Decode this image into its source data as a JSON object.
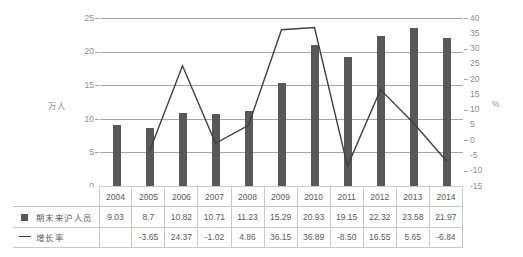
{
  "chart_data": {
    "type": "bar",
    "title": "",
    "xlabel": "",
    "ylabel": "万人",
    "ylabel_right": "%",
    "ylim": [
      0,
      25
    ],
    "ylim_right": [
      -15,
      40
    ],
    "grid": true,
    "legend_position": "table-below",
    "categories": [
      "2004",
      "2005",
      "2006",
      "2007",
      "2008",
      "2009",
      "2010",
      "2011",
      "2012",
      "2013",
      "2014"
    ],
    "series": [
      {
        "name": "期末来沪人员",
        "type": "bar",
        "axis": "left",
        "unit": "万人",
        "color": "#585858",
        "marker": "square",
        "values": [
          9.03,
          8.7,
          10.82,
          10.71,
          11.23,
          15.29,
          20.93,
          19.15,
          22.32,
          23.58,
          21.97
        ],
        "labels": [
          "9.03",
          "8.7",
          "10.82",
          "10.71",
          "11.23",
          "15.29",
          "20.93",
          "19.15",
          "22.32",
          "23.58",
          "21.97"
        ]
      },
      {
        "name": "增长率",
        "type": "line",
        "axis": "right",
        "unit": "%",
        "color": "#3f3f3f",
        "marker": "line",
        "values": [
          null,
          -3.65,
          24.37,
          -1.02,
          4.86,
          36.15,
          36.89,
          -8.5,
          16.55,
          5.65,
          -6.84
        ],
        "labels": [
          "",
          "-3.65",
          "24.37",
          "-1.02",
          "4.86",
          "36.15",
          "36.89",
          "-8.50",
          "16.55",
          "5.65",
          "-6.84"
        ]
      }
    ],
    "yticks_left": [
      "0",
      "5",
      "10",
      "15",
      "20",
      "25"
    ],
    "yticks_right": [
      "-15",
      "-10",
      "-5",
      "0",
      "5",
      "10",
      "15",
      "20",
      "25",
      "30",
      "35",
      "40"
    ]
  },
  "axes": {
    "left_label": "万人",
    "right_label": "%",
    "left_ticks": [
      "25",
      "20",
      "15",
      "10",
      "5",
      "0"
    ],
    "right_ticks": [
      "40",
      "35",
      "30",
      "25",
      "20",
      "15",
      "10",
      "5",
      "0",
      "-5",
      "-10",
      "-15"
    ]
  },
  "table": {
    "year_header": [
      "2004",
      "2005",
      "2006",
      "2007",
      "2008",
      "2009",
      "2010",
      "2011",
      "2012",
      "2013",
      "2014"
    ],
    "rows": [
      {
        "legend": "期末来沪人员",
        "marker": "square-marker-icon",
        "values": [
          "9.03",
          "8.7",
          "10.82",
          "10.71",
          "11.23",
          "15.29",
          "20.93",
          "19.15",
          "22.32",
          "23.58",
          "21.97"
        ]
      },
      {
        "legend": "增长率",
        "marker": "line-marker-icon",
        "values": [
          "",
          "-3.65",
          "24.37",
          "-1.02",
          "4.86",
          "36.15",
          "36.89",
          "-8.50",
          "16.55",
          "5.65",
          "-6.84"
        ]
      }
    ]
  },
  "colors": {
    "bar": "#585858",
    "line": "#3f3f3f",
    "grid": "#a6a6a6",
    "text": "#595959",
    "tick_text": "#8c8c8c",
    "table_border": "#c9c9c9"
  }
}
